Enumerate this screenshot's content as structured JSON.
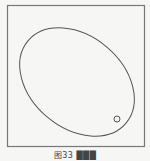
{
  "figure": {
    "frame": {
      "x": 7.5,
      "y": 5.5,
      "width": 137,
      "height": 141,
      "stroke": "#777777"
    },
    "ellipse": {
      "cx": 77,
      "cy": 82,
      "rx": 64,
      "ry": 46,
      "rotate": 40,
      "stroke": "#555555"
    },
    "small_circle": {
      "cx": 117,
      "cy": 119,
      "r": 3,
      "stroke": "#555555"
    },
    "caption": "图33  ███"
  }
}
